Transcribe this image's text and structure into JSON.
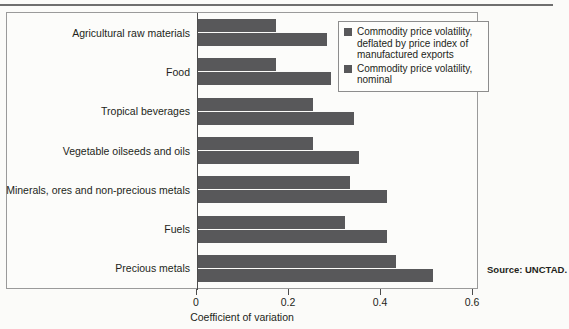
{
  "chart_data": {
    "type": "bar",
    "orientation": "horizontal",
    "title": "",
    "xlabel": "Coefficient of variation",
    "ylabel": "",
    "xlim": [
      0,
      0.6
    ],
    "xticks": [
      "0",
      "0.2",
      "0.4",
      "0.6"
    ],
    "xtick_values": [
      0,
      0.2,
      0.4,
      0.6
    ],
    "grid": false,
    "legend_position": "top-right",
    "categories": [
      "Agricultural raw materials",
      "Food",
      "Tropical beverages",
      "Vegetable oilseeds and oils",
      "Minerals, ores and non-precious metals",
      "Fuels",
      "Precious metals"
    ],
    "series": [
      {
        "name": "Commodity price volatility, deflated by price index of manufactured exports",
        "color": "#58585a",
        "values": [
          0.17,
          0.17,
          0.25,
          0.25,
          0.33,
          0.32,
          0.43
        ]
      },
      {
        "name": "Commodity price volatility, nominal",
        "color": "#58585a",
        "values": [
          0.28,
          0.29,
          0.34,
          0.35,
          0.41,
          0.41,
          0.51
        ]
      }
    ]
  },
  "legend": {
    "items": [
      {
        "label": "Commodity price volatility, deflated by price index of manufactured exports",
        "swatch": "legend-swatch-deflated"
      },
      {
        "label": "Commodity price volatility, nominal",
        "swatch": "legend-swatch-nominal"
      }
    ]
  },
  "axis": {
    "x_title": "Coefficient of variation"
  },
  "source": {
    "text": "Source: UNCTAD."
  },
  "colors": {
    "bar": "#58585a",
    "axis": "#4d4d4d",
    "border": "#9a9a9a",
    "text": "#231f20",
    "background": "#fbfbf9"
  }
}
